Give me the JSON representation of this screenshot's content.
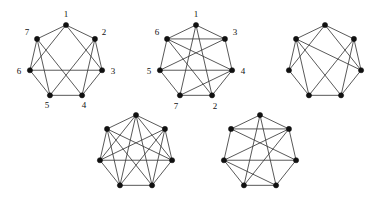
{
  "figure": {
    "caption": "",
    "background_color": "#ffffff",
    "edge_color": "#3b3b3b",
    "vertex_color": "#111111",
    "label_color": "#111111",
    "vertex_radius": 2.6,
    "label_font_size": 9,
    "graphs": [
      {
        "id": "graph-1",
        "labeled": true,
        "vertex_count": 7,
        "center": [
          66,
          62
        ],
        "radius": 37,
        "start_angle_deg": -90,
        "labels": [
          "1",
          "2",
          "3",
          "4",
          "5",
          "6",
          "7"
        ],
        "label_offsets": [
          [
            0,
            -10
          ],
          [
            9,
            -6
          ],
          [
            11,
            2
          ],
          [
            2,
            11
          ],
          [
            -3,
            11
          ],
          [
            -11,
            2
          ],
          [
            -10,
            -6
          ]
        ],
        "cycle_edges": [
          [
            0,
            1
          ],
          [
            1,
            2
          ],
          [
            2,
            3
          ],
          [
            3,
            4
          ],
          [
            4,
            5
          ],
          [
            5,
            6
          ],
          [
            6,
            0
          ]
        ],
        "chord_edges": [
          [
            0,
            2
          ],
          [
            0,
            5
          ],
          [
            1,
            3
          ],
          [
            1,
            4
          ],
          [
            2,
            5
          ],
          [
            3,
            6
          ],
          [
            4,
            6
          ]
        ],
        "degree_sequence": [
          4,
          4,
          4,
          4,
          4,
          4,
          4
        ],
        "edge_count": 14
      },
      {
        "id": "graph-2",
        "labeled": true,
        "vertex_count": 7,
        "center": [
          196,
          62
        ],
        "radius": 37,
        "start_angle_deg": -90,
        "labels": [
          "1",
          "3",
          "4",
          "2",
          "7",
          "5",
          "6"
        ],
        "label_offsets": [
          [
            0,
            -10
          ],
          [
            10,
            -6
          ],
          [
            11,
            2
          ],
          [
            3,
            12
          ],
          [
            -4,
            12
          ],
          [
            -11,
            2
          ],
          [
            -10,
            -6
          ]
        ],
        "cycle_edges": [
          [
            0,
            1
          ],
          [
            1,
            2
          ],
          [
            2,
            3
          ],
          [
            3,
            4
          ],
          [
            4,
            5
          ],
          [
            5,
            6
          ],
          [
            6,
            0
          ]
        ],
        "chord_edges": [
          [
            0,
            3
          ],
          [
            0,
            4
          ],
          [
            1,
            5
          ],
          [
            2,
            6
          ],
          [
            2,
            4
          ],
          [
            3,
            6
          ],
          [
            1,
            6
          ],
          [
            5,
            2
          ]
        ],
        "degree_sequence": [
          4,
          4,
          5,
          4,
          4,
          4,
          5
        ],
        "edge_count": 15
      },
      {
        "id": "graph-3",
        "labeled": false,
        "vertex_count": 7,
        "center": [
          325,
          62
        ],
        "radius": 37,
        "start_angle_deg": -90,
        "labels": [],
        "label_offsets": [],
        "cycle_edges": [
          [
            0,
            1
          ],
          [
            1,
            2
          ],
          [
            2,
            3
          ],
          [
            3,
            4
          ],
          [
            4,
            5
          ],
          [
            5,
            6
          ],
          [
            6,
            0
          ]
        ],
        "chord_edges": [
          [
            0,
            2
          ],
          [
            0,
            5
          ],
          [
            1,
            4
          ],
          [
            2,
            6
          ],
          [
            3,
            6
          ],
          [
            1,
            3
          ],
          [
            4,
            6
          ]
        ],
        "degree_sequence": [
          4,
          4,
          4,
          4,
          4,
          4,
          4
        ],
        "edge_count": 14
      },
      {
        "id": "graph-4",
        "labeled": false,
        "vertex_count": 7,
        "center": [
          136,
          152
        ],
        "radius": 37,
        "start_angle_deg": -90,
        "labels": [],
        "label_offsets": [],
        "cycle_edges": [
          [
            0,
            1
          ],
          [
            1,
            2
          ],
          [
            2,
            3
          ],
          [
            3,
            4
          ],
          [
            4,
            5
          ],
          [
            5,
            6
          ],
          [
            6,
            0
          ]
        ],
        "chord_edges": [
          [
            0,
            2
          ],
          [
            0,
            3
          ],
          [
            0,
            4
          ],
          [
            0,
            5
          ],
          [
            1,
            3
          ],
          [
            1,
            4
          ],
          [
            1,
            5
          ],
          [
            2,
            5
          ],
          [
            2,
            6
          ],
          [
            3,
            6
          ],
          [
            4,
            6
          ]
        ],
        "degree_sequence": [
          6,
          5,
          5,
          5,
          5,
          5,
          5
        ],
        "edge_count": 18
      },
      {
        "id": "graph-5",
        "labeled": false,
        "vertex_count": 7,
        "center": [
          260,
          152
        ],
        "radius": 37,
        "start_angle_deg": -90,
        "labels": [],
        "label_offsets": [],
        "cycle_edges": [
          [
            0,
            1
          ],
          [
            1,
            2
          ],
          [
            2,
            3
          ],
          [
            3,
            4
          ],
          [
            4,
            5
          ],
          [
            5,
            6
          ],
          [
            6,
            0
          ]
        ],
        "chord_edges": [
          [
            0,
            3
          ],
          [
            0,
            4
          ],
          [
            1,
            4
          ],
          [
            1,
            6
          ],
          [
            2,
            5
          ],
          [
            2,
            6
          ],
          [
            3,
            5
          ],
          [
            1,
            5
          ]
        ],
        "degree_sequence": [
          4,
          5,
          4,
          4,
          4,
          5,
          4
        ],
        "edge_count": 15
      }
    ]
  }
}
